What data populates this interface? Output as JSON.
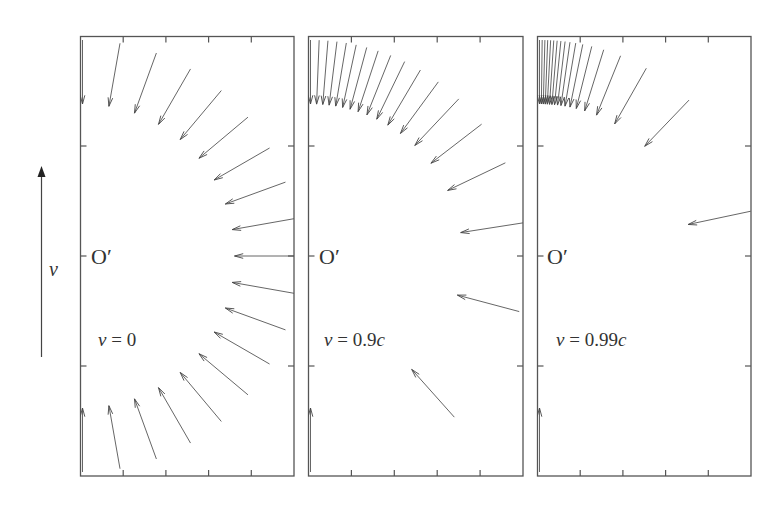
{
  "figure": {
    "velocity_arrow": {
      "label": "v",
      "x": 41.5,
      "y_tail": 357,
      "y_tip": 166
    },
    "origin_label": "O′",
    "arrow_geometry": {
      "center_y": 256,
      "inner_radius": 152,
      "outer_radius": 216,
      "source_angles_deg": [
        0,
        10,
        20,
        30,
        40,
        50,
        60,
        70,
        80,
        90,
        100,
        110,
        120,
        130,
        140,
        150,
        160,
        170,
        180
      ],
      "head_length": 9,
      "head_angle_deg": 15
    },
    "frame": {
      "top": 36.5,
      "bottom": 476,
      "side_ticks_y": [
        146,
        256,
        366
      ],
      "bottom_tick_fractions": [
        0.2,
        0.4,
        0.6,
        0.8
      ]
    },
    "panels": [
      {
        "id": "panel-v0",
        "left": 80.5,
        "right": 294,
        "beta": 0,
        "label_var": "v",
        "label_eq": " = 0",
        "label_x": 98,
        "label_y": 346,
        "origin_x": 91
      },
      {
        "id": "panel-v09c",
        "left": 308.5,
        "right": 523,
        "beta": 0.9,
        "label_var": "v",
        "label_eq": " = 0.9",
        "label_suffix": "c",
        "label_x": 324,
        "label_y": 346,
        "origin_x": 319
      },
      {
        "id": "panel-v099c",
        "left": 537.5,
        "right": 751,
        "beta": 0.99,
        "label_var": "v",
        "label_eq": " = 0.99",
        "label_suffix": "c",
        "label_x": 556,
        "label_y": 346,
        "origin_x": 547
      }
    ]
  },
  "colors": {
    "line": "#555555",
    "text": "#333333",
    "background": "#ffffff"
  }
}
